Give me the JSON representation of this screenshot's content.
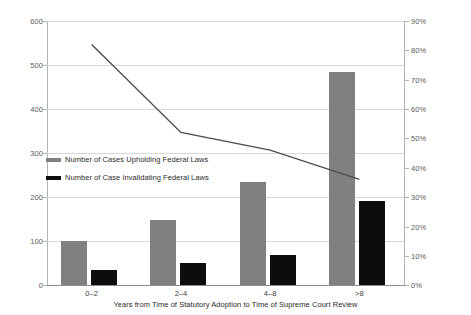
{
  "chart_data": {
    "type": "bar",
    "title": "",
    "subtitle": "",
    "xlabel": "Years from Time of Statutory Adoption to Time of Supreme Court Review",
    "ylabel": "",
    "categories": [
      "0–2",
      "2–4",
      "4–8",
      ">8"
    ],
    "series": [
      {
        "name": "Number of Cases Upholding Federal Laws",
        "type": "bar",
        "axis": "left",
        "color": "#808080",
        "values": [
          100,
          147,
          233,
          483
        ]
      },
      {
        "name": "Number of Case Invalidating Federal Laws",
        "type": "bar",
        "axis": "left",
        "color": "#0d0d0d",
        "values": [
          35,
          50,
          68,
          191
        ]
      },
      {
        "name": "Percent",
        "type": "line",
        "axis": "right",
        "color": "#4d4d4d",
        "values": [
          82,
          52,
          46,
          36
        ]
      }
    ],
    "ylim": [
      0,
      600
    ],
    "yticks": [
      0,
      100,
      200,
      300,
      400,
      500,
      600
    ],
    "ytick_labels": [
      "0",
      "100",
      "200",
      "300",
      "400",
      "500",
      "600"
    ],
    "y2lim": [
      0,
      90
    ],
    "y2ticks": [
      0,
      10,
      20,
      30,
      40,
      50,
      60,
      70,
      80,
      90
    ],
    "y2tick_labels": [
      "0%",
      "10%",
      "20%",
      "30%",
      "40%",
      "50%",
      "60%",
      "70%",
      "80%",
      "90%"
    ],
    "grid": true,
    "legend_position": "inside-left"
  },
  "legend": {
    "items": [
      {
        "label": "Number of Cases Upholding Federal Laws",
        "swatch": "upholding"
      },
      {
        "label": "Number of Case Invalidating Federal Laws",
        "swatch": "invalidating"
      }
    ]
  }
}
